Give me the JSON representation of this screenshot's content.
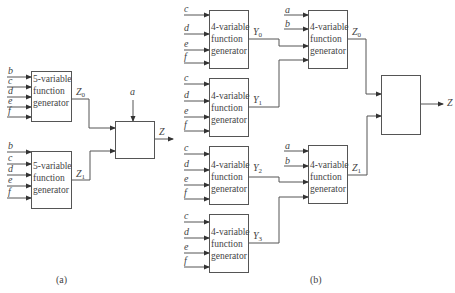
{
  "figure": {
    "part_a": {
      "caption": "(a)",
      "generators": [
        {
          "line1": "5-variable",
          "line2": "function",
          "line3": "generator",
          "inputs": [
            "b",
            "c",
            "d",
            "e",
            "f"
          ],
          "output": "Z",
          "output_sub": "0"
        },
        {
          "line1": "5-variable",
          "line2": "function",
          "line3": "generator",
          "inputs": [
            "b",
            "c",
            "d",
            "e",
            "f"
          ],
          "output": "Z",
          "output_sub": "1"
        }
      ],
      "mux": {
        "select": "a",
        "output": "Z"
      }
    },
    "part_b": {
      "caption": "(b)",
      "first_level": [
        {
          "line1": "4-variable",
          "line2": "function",
          "line3": "generator",
          "inputs": [
            "c",
            "d",
            "e",
            "f"
          ],
          "output": "Y",
          "output_sub": "0"
        },
        {
          "line1": "4-variable",
          "line2": "function",
          "line3": "generator",
          "inputs": [
            "c",
            "d",
            "e",
            "f"
          ],
          "output": "Y",
          "output_sub": "1"
        },
        {
          "line1": "4-variable",
          "line2": "function",
          "line3": "generator",
          "inputs": [
            "c",
            "d",
            "e",
            "f"
          ],
          "output": "Y",
          "output_sub": "2"
        },
        {
          "line1": "4-variable",
          "line2": "function",
          "line3": "generator",
          "inputs": [
            "c",
            "d",
            "e",
            "f"
          ],
          "output": "Y",
          "output_sub": "3"
        }
      ],
      "second_level": [
        {
          "line1": "4-variable",
          "line2": "function",
          "line3": "generator",
          "inputs": [
            "a",
            "b"
          ],
          "output": "Z",
          "output_sub": "0"
        },
        {
          "line1": "4-variable",
          "line2": "function",
          "line3": "generator",
          "inputs": [
            "a",
            "b"
          ],
          "output": "Z",
          "output_sub": "1"
        }
      ],
      "final": {
        "output": "Z"
      }
    },
    "line_color": "#555555"
  }
}
